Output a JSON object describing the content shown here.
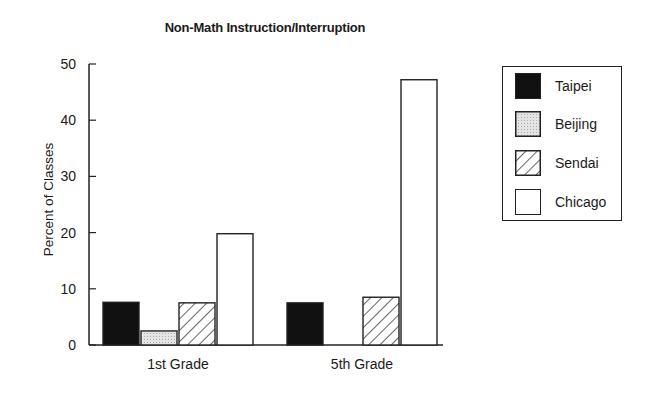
{
  "chart_data": {
    "type": "bar",
    "title": "Non-Math Instruction/Interruption",
    "xlabel": "",
    "ylabel": "Percent of Classes",
    "ylim": [
      0,
      50
    ],
    "yticks": [
      0,
      10,
      20,
      30,
      40,
      50
    ],
    "grid": false,
    "legend_position": "right",
    "categories": [
      "1st Grade",
      "5th Grade"
    ],
    "series": [
      {
        "name": "Taipei",
        "values": [
          7.6,
          7.5
        ],
        "fill": "solid-black"
      },
      {
        "name": "Beijing",
        "values": [
          2.5,
          0
        ],
        "fill": "light-gray-stipple"
      },
      {
        "name": "Sendai",
        "values": [
          7.5,
          8.5
        ],
        "fill": "diagonal-hatch"
      },
      {
        "name": "Chicago",
        "values": [
          19.8,
          47.2
        ],
        "fill": "white"
      }
    ]
  },
  "legend": {
    "items": [
      {
        "label": "Taipei"
      },
      {
        "label": "Beijing"
      },
      {
        "label": "Sendai"
      },
      {
        "label": "Chicago"
      }
    ]
  }
}
